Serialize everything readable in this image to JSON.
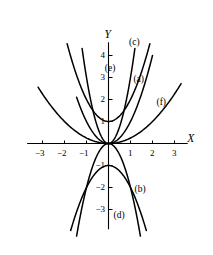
{
  "chart_data": {
    "type": "line",
    "title": "",
    "xlabel": "X",
    "ylabel": "Y",
    "xlim": [
      -3.7,
      3.6
    ],
    "ylim": [
      -3.9,
      4.6
    ],
    "grid": false,
    "legend": "inline-curve-labels",
    "x_ticks": [
      -3,
      -2,
      -1,
      1,
      2,
      3
    ],
    "x_tick_labels": [
      "-3",
      "-2",
      "-1",
      "1",
      "2",
      "3"
    ],
    "y_ticks": [
      -3,
      -2,
      -1,
      1,
      2,
      3,
      4
    ],
    "y_tick_labels": [
      "-3",
      "-2",
      "-1",
      "1",
      "2",
      "3",
      "4"
    ],
    "series": [
      {
        "name": "(a)",
        "label": "(a)",
        "equation": "y = x^2",
        "form": "parabola",
        "a": 1,
        "vertex": [
          0,
          0
        ],
        "opens": "up",
        "label_pos": [
          1.45,
          2.9
        ],
        "x_range": [
          -1.45,
          2.0
        ]
      },
      {
        "name": "(b)",
        "label": "(b)",
        "equation": "y = -2x^2",
        "form": "parabola",
        "a": -2,
        "vertex": [
          0,
          0
        ],
        "opens": "down",
        "label_pos": [
          1.5,
          -2.1
        ],
        "x_range": [
          -1.45,
          1.45
        ]
      },
      {
        "name": "(c)",
        "label": "(c)",
        "equation": "y = 3x^2",
        "form": "parabola",
        "a": 3,
        "vertex": [
          0,
          0
        ],
        "opens": "up",
        "label_pos": [
          1.25,
          4.55
        ],
        "x_range": [
          -1.2,
          1.2
        ]
      },
      {
        "name": "(d)",
        "label": "(d)",
        "equation": "y = -x^2 - 1",
        "form": "parabola",
        "a": -1,
        "vertex": [
          0,
          -1
        ],
        "opens": "down",
        "label_pos": [
          0.55,
          -3.3
        ],
        "x_range": [
          -1.72,
          1.72
        ]
      },
      {
        "name": "(e)",
        "label": "(e)",
        "equation": "y = x^2 + 1",
        "form": "parabola",
        "a": 1,
        "vertex": [
          0,
          1
        ],
        "opens": "up",
        "label_pos": [
          0.15,
          3.4
        ],
        "x_range": [
          -1.88,
          1.88
        ]
      },
      {
        "name": "(f)",
        "label": "(f)",
        "equation": "y = 0.25x^2",
        "form": "parabola",
        "a": 0.25,
        "vertex": [
          0,
          0
        ],
        "opens": "up",
        "label_pos": [
          2.5,
          1.85
        ],
        "x_range": [
          -3.2,
          3.3
        ]
      }
    ],
    "curve_labels": [
      "(a)",
      "(b)",
      "(c)",
      "(d)",
      "(e)",
      "(f)"
    ],
    "colors": {
      "curve": "#000000",
      "axis": "#000000",
      "background": "#ffffff"
    }
  }
}
